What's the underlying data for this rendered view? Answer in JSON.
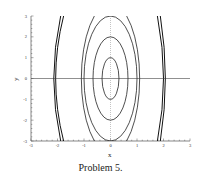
{
  "chart_data": {
    "type": "line",
    "title": "",
    "xlabel": "x",
    "ylabel": "y",
    "xlim": [
      -3,
      3
    ],
    "ylim": [
      -3,
      3
    ],
    "x_ticks": [
      -3,
      -2,
      -1,
      0,
      1,
      2,
      3
    ],
    "y_ticks": [
      -3,
      -2,
      -1,
      0,
      1,
      2,
      3
    ],
    "grid": false,
    "legend": null,
    "series": [
      {
        "name": "ellipse-1",
        "kind": "ellipse",
        "center": [
          0,
          0
        ],
        "a": 0.32,
        "b": 1.0
      },
      {
        "name": "ellipse-2",
        "kind": "ellipse",
        "center": [
          0,
          0
        ],
        "a": 0.66,
        "b": 2.0
      },
      {
        "name": "ellipse-3",
        "kind": "ellipse",
        "center": [
          0,
          0
        ],
        "a": 1.0,
        "b": 3.0
      },
      {
        "name": "ellipse-4",
        "kind": "ellipse",
        "center": [
          0,
          0
        ],
        "a": 1.1,
        "b": 3.6
      },
      {
        "name": "outer-left-1",
        "kind": "open-curve",
        "points": [
          [
            -1.88,
            3
          ],
          [
            -2.14,
            0
          ],
          [
            -1.88,
            -3
          ]
        ]
      },
      {
        "name": "outer-left-2",
        "kind": "open-curve",
        "points": [
          [
            -1.77,
            3
          ],
          [
            -2.07,
            0
          ],
          [
            -1.77,
            -3
          ]
        ]
      },
      {
        "name": "outer-right-1",
        "kind": "open-curve",
        "points": [
          [
            1.77,
            3
          ],
          [
            2.0,
            0
          ],
          [
            1.77,
            -3
          ]
        ]
      },
      {
        "name": "outer-right-2",
        "kind": "open-curve",
        "points": [
          [
            1.88,
            3
          ],
          [
            2.07,
            0
          ],
          [
            1.88,
            -3
          ]
        ]
      }
    ]
  },
  "axes": {
    "x_label": "x",
    "y_label": "y",
    "x_tick_labels": [
      "-3",
      "-2",
      "-1",
      "0",
      "1",
      "2",
      "3"
    ],
    "y_tick_labels": [
      "3",
      "2",
      "1",
      "0",
      "-1",
      "-2",
      "-3"
    ]
  },
  "caption": "Problem 5."
}
